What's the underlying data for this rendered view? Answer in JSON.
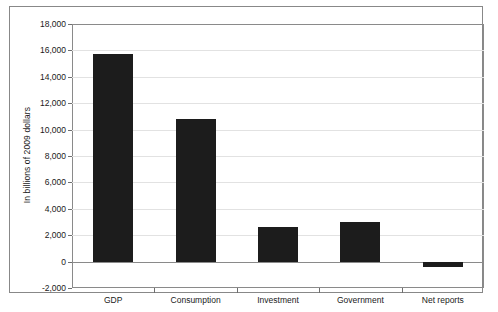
{
  "chart_data": {
    "type": "bar",
    "title": "",
    "subtitle": "",
    "xlabel": "",
    "ylabel": "In billions of 2009 dollars",
    "categories": [
      "GDP",
      "Consumption",
      "Investment",
      "Government",
      "Net reports"
    ],
    "values": [
      15750,
      10800,
      2600,
      3000,
      -420
    ],
    "ylim": [
      -2000,
      18000
    ],
    "ytick_labels": [
      "18,000",
      "16,000",
      "14,000",
      "12,000",
      "10,000",
      "8,000",
      "6,000",
      "4,000",
      "2,000",
      "0",
      "-2,000"
    ],
    "ytick_values": [
      18000,
      16000,
      14000,
      12000,
      10000,
      8000,
      6000,
      4000,
      2000,
      0,
      -2000
    ],
    "grid": true,
    "legend": "none",
    "bar_color": "#1c1c1c",
    "grid_color": "#e2e2e2",
    "axis_color": "#8a8a8a",
    "background": "#ffffff"
  }
}
